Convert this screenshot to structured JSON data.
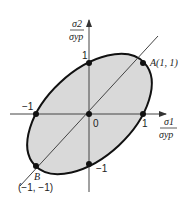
{
  "diagram": {
    "type": "yield-criterion-ellipse",
    "axes": {
      "x_label_num": "σ1",
      "x_label_den": "σyp",
      "y_label_num": "σ2",
      "y_label_den": "σyp"
    },
    "ticks": {
      "x_pos": "1",
      "x_neg": "−1",
      "y_pos": "1",
      "y_neg": "−1",
      "origin": "0"
    },
    "points": {
      "A": {
        "label": "A(1, 1)",
        "coords": [
          1,
          1
        ]
      },
      "B": {
        "label": "B",
        "coords_label": "(−1, −1)",
        "coords": [
          -1,
          -1
        ]
      }
    },
    "colors": {
      "fill": "#d9d9d9",
      "stroke": "#111111",
      "axis": "#444444"
    }
  }
}
